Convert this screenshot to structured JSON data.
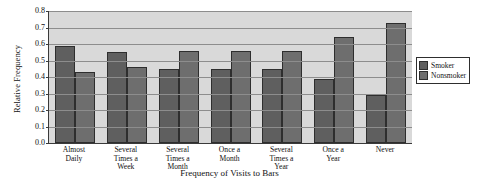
{
  "chart_data": {
    "type": "bar",
    "title": "",
    "xlabel": "Frequency of Visits to Bars",
    "ylabel": "Relative Frequency",
    "ylim": [
      0.0,
      0.8
    ],
    "ytick_labels": [
      "0.8",
      "0.7",
      "0.6",
      "0.5",
      "0.4",
      "0.3",
      "0.2",
      "0.1",
      "0.0"
    ],
    "ytick_values": [
      0.8,
      0.7,
      0.6,
      0.5,
      0.4,
      0.3,
      0.2,
      0.1,
      0.0
    ],
    "grid": true,
    "legend_position": "right",
    "categories": [
      "Almost Daily",
      "Several Times a Week",
      "Several Times a Month",
      "Once a Month",
      "Several Times a Year",
      "Once a Year",
      "Never"
    ],
    "category_lines": [
      [
        "Almost",
        "Daily"
      ],
      [
        "Several",
        "Times a",
        "Week"
      ],
      [
        "Several",
        "Times a",
        "Month"
      ],
      [
        "Once a",
        "Month"
      ],
      [
        "Several",
        "Times a",
        "Year"
      ],
      [
        "Once a",
        "Year"
      ],
      [
        "Never"
      ]
    ],
    "series": [
      {
        "name": "Smoker",
        "color": "#5f5f5f",
        "values": [
          0.59,
          0.55,
          0.45,
          0.45,
          0.45,
          0.39,
          0.29
        ]
      },
      {
        "name": "Nonsmoker",
        "color": "#6e6e6e",
        "values": [
          0.43,
          0.46,
          0.56,
          0.56,
          0.56,
          0.64,
          0.73
        ]
      }
    ]
  },
  "legend": {
    "items": [
      {
        "label": "Smoker"
      },
      {
        "label": "Nonsmoker"
      }
    ]
  },
  "colors": {
    "plot_background": "#d9d9d9",
    "gridline": "#8d8d8d",
    "axis": "#3a3a3a",
    "smoker": "#5f5f5f",
    "nonsmoker": "#6e6e6e"
  }
}
